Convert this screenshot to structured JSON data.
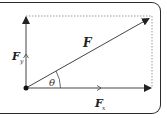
{
  "diagram": {
    "type": "force-vector-decomposition",
    "colors": {
      "line": "#333333",
      "dotted": "#888888",
      "frame": "#2a2a2a",
      "background": "#ffffff"
    },
    "origin": {
      "x": 26,
      "y": 88
    },
    "vectors": [
      {
        "id": "F",
        "label": "F",
        "subscript": "",
        "from": [
          26,
          88
        ],
        "to": [
          150,
          18
        ],
        "role": "resultant"
      },
      {
        "id": "Fx",
        "label": "F",
        "subscript": "x",
        "from": [
          26,
          88
        ],
        "to": [
          152,
          88
        ],
        "role": "horizontal-component"
      },
      {
        "id": "Fy",
        "label": "F",
        "subscript": "y",
        "from": [
          26,
          88
        ],
        "to": [
          26,
          16
        ],
        "role": "vertical-component"
      }
    ],
    "angle": {
      "symbol": "θ",
      "between": [
        "Fx",
        "F"
      ]
    },
    "dotted_lines": [
      {
        "from": [
          26,
          16
        ],
        "to": [
          152,
          16
        ]
      },
      {
        "from": [
          152,
          16
        ],
        "to": [
          152,
          88
        ]
      }
    ]
  }
}
